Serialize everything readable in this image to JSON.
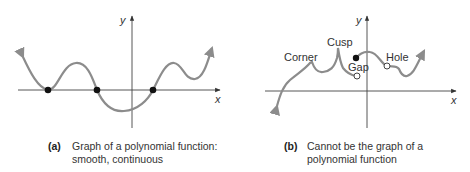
{
  "panel_a": {
    "axis_x_label": "x",
    "axis_y_label": "y",
    "caption_tag": "(a)",
    "caption_line1": "Graph of a polynomial function:",
    "caption_line2": "smooth, continuous",
    "curve_color": "#8c8c8c",
    "zeros_count": 3
  },
  "panel_b": {
    "axis_x_label": "x",
    "axis_y_label": "y",
    "caption_tag": "(b)",
    "caption_line1": "Cannot be the graph of a",
    "caption_line2": "polynomial function",
    "annotations": {
      "corner": "Corner",
      "cusp": "Cusp",
      "gap": "Gap",
      "hole": "Hole"
    },
    "curve_color": "#8c8c8c"
  }
}
